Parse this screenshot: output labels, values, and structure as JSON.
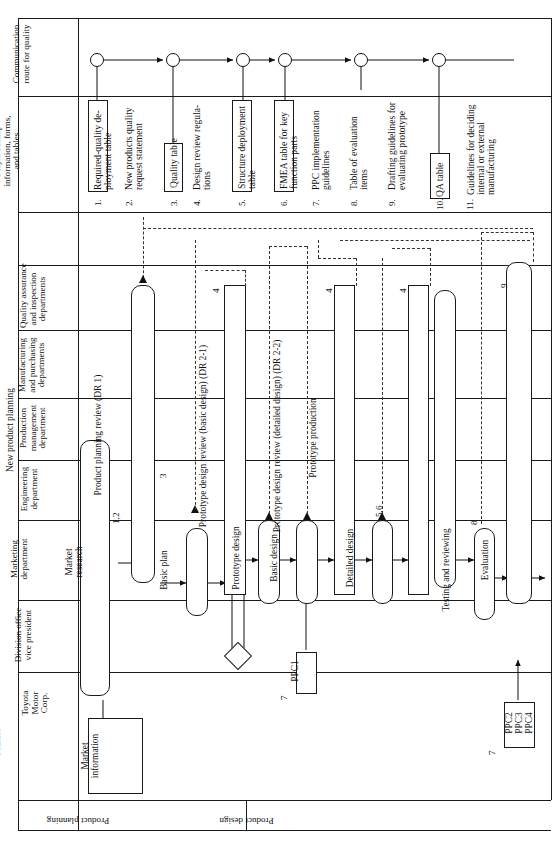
{
  "diagram": {
    "orientation": "rotated-90-ccw"
  },
  "row_headers": {
    "communication": "Communication\nroute for quality",
    "backup": "Major backup\ninformation, forms,\nand tables"
  },
  "lanes": [
    {
      "id": "qa",
      "label": "Quality assurance\nand inspection\ndepartments"
    },
    {
      "id": "mfg",
      "label": "Manufacturing\nand purchasing\ndepartments"
    },
    {
      "id": "pmd",
      "label": "Production\nmanagement\ndepartment"
    },
    {
      "id": "eng",
      "label": "Engineering\ndepartment"
    },
    {
      "id": "mkt",
      "label": "Marketing\ndepartment"
    },
    {
      "id": "vp",
      "label": "Division office\nvice president"
    },
    {
      "id": "tmc",
      "label": "Toyota\nMotor\nCorp."
    },
    {
      "id": "mark",
      "label": "Market"
    }
  ],
  "backup_items": [
    {
      "n": "1.",
      "text": "Required-quality de-\nployment table",
      "boxed": true
    },
    {
      "n": "2.",
      "text": "New products quality\nrequest statement",
      "boxed": false
    },
    {
      "n": "3.",
      "text": "Quality table",
      "boxed": true
    },
    {
      "n": "4.",
      "text": "Design review regula-\ntions",
      "boxed": false
    },
    {
      "n": "5.",
      "text": "Structure deployment\ntable",
      "boxed": true
    },
    {
      "n": "6.",
      "text": "FMEA table for key\nfunction parts",
      "boxed": true
    },
    {
      "n": "7.",
      "text": "PPC implementation\nguidelines",
      "boxed": false
    },
    {
      "n": "8.",
      "text": "Table of evaluation\nitems",
      "boxed": false
    },
    {
      "n": "9.",
      "text": "Drafting guidelines for\nevaluating prototype",
      "boxed": false
    },
    {
      "n": "10.",
      "text": "QA table",
      "boxed": true
    },
    {
      "n": "11.",
      "text": "Guidelines for deciding\ninternal or external\nmanufacturing",
      "boxed": false
    }
  ],
  "process_nodes": [
    {
      "id": "market-information",
      "label": "Market\ninformation"
    },
    {
      "id": "market-research",
      "label": "Market\nresearch"
    },
    {
      "id": "new-product-planning",
      "label": "New product planning"
    },
    {
      "id": "basic-plan",
      "label": "Basic plan"
    },
    {
      "id": "product-planning-review",
      "label": "Product planning review (DR 1)"
    },
    {
      "id": "prototype-design",
      "label": "Prototype design"
    },
    {
      "id": "basic-design",
      "label": "Basic design"
    },
    {
      "id": "ppc1",
      "label": "PPC1"
    },
    {
      "id": "pdr-basic-design",
      "label": "Prototype design review (basic design) (DR 2-1)"
    },
    {
      "id": "detailed-design",
      "label": "Detailed design"
    },
    {
      "id": "pdr-detailed-design",
      "label": "Prototype design review (detailed design) (DR 2-2)"
    },
    {
      "id": "prototype-production",
      "label": "Prototype production"
    },
    {
      "id": "testing-reviewing",
      "label": "Testing and reviewing"
    },
    {
      "id": "evaluation",
      "label": "Evaluation"
    },
    {
      "id": "ppc234",
      "label": "PPC2\nPPC3\nPPC4"
    }
  ],
  "annotations": [
    {
      "id": "a12",
      "text": "1,2"
    },
    {
      "id": "a3",
      "text": "3"
    },
    {
      "id": "a4a",
      "text": "4"
    },
    {
      "id": "a4b",
      "text": "4"
    },
    {
      "id": "a4c",
      "text": "4"
    },
    {
      "id": "a56",
      "text": "5,6"
    },
    {
      "id": "a7a",
      "text": "7"
    },
    {
      "id": "a7b",
      "text": "7"
    },
    {
      "id": "a8",
      "text": "8"
    },
    {
      "id": "a9",
      "text": "9"
    }
  ],
  "phase_bands": [
    {
      "id": "product-planning",
      "label": "Product planning"
    },
    {
      "id": "product-design",
      "label": "Product design"
    }
  ],
  "colors": {
    "line": "#1a1a1a",
    "dash": "#333333",
    "background": "#ffffff"
  }
}
